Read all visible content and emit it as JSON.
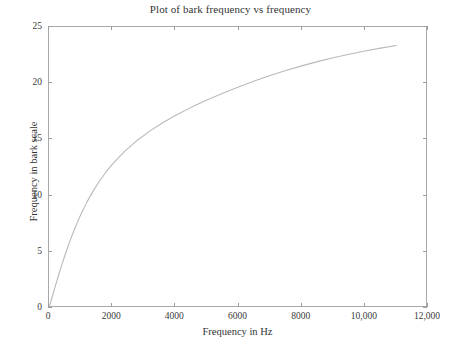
{
  "chart_data": {
    "type": "line",
    "title": "Plot of bark frequency vs frequency",
    "xlabel": "Frequency in Hz",
    "ylabel": "Frequency in bark scale",
    "xlim": [
      0,
      12000
    ],
    "ylim": [
      0,
      25
    ],
    "grid": false,
    "legend": null,
    "xticks": [
      0,
      2000,
      4000,
      6000,
      8000,
      10000,
      12000
    ],
    "xtick_labels": [
      "0",
      "2000",
      "4000",
      "6000",
      "8000",
      "10,000",
      "12,000"
    ],
    "yticks": [
      0,
      5,
      10,
      15,
      20,
      25
    ],
    "ytick_labels": [
      "0",
      "5",
      "10",
      "15",
      "20",
      "25"
    ],
    "line_color": "#b9b9b9",
    "axis_color": "#a9a9a9",
    "series": [
      {
        "name": "bark frequency",
        "x": [
          0,
          100,
          200,
          300,
          400,
          500,
          600,
          700,
          800,
          900,
          1000,
          1200,
          1400,
          1600,
          1800,
          2000,
          2400,
          2800,
          3200,
          3600,
          4000,
          4500,
          5000,
          5500,
          6000,
          6500,
          7000,
          7500,
          8000,
          8500,
          9000,
          9500,
          10000,
          10500,
          11000
        ],
        "y": [
          0,
          0.98,
          1.95,
          2.89,
          3.79,
          4.65,
          5.47,
          6.24,
          6.96,
          7.64,
          8.27,
          9.42,
          10.42,
          11.3,
          12.08,
          12.77,
          13.95,
          14.93,
          15.76,
          16.48,
          17.13,
          17.85,
          18.5,
          19.1,
          19.67,
          20.19,
          20.68,
          21.13,
          21.54,
          21.92,
          22.27,
          22.58,
          22.86,
          23.12,
          23.35
        ]
      }
    ]
  },
  "axes": {
    "title": "Plot of bark frequency vs frequency",
    "x_axis_label": "Frequency in Hz",
    "y_axis_label": "Frequency in bark scale"
  }
}
